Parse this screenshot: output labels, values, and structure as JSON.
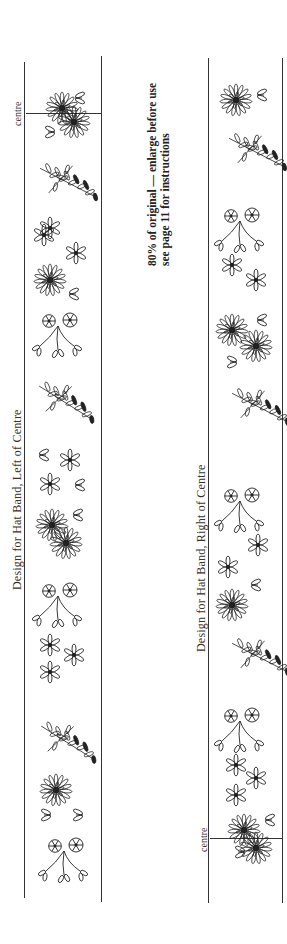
{
  "page": {
    "orientation": "rotated-90",
    "note": {
      "line1": "80% of original — enlarge before use",
      "line2": "see page 11 for instructions"
    }
  },
  "bands": [
    {
      "id": "left-of-centre",
      "title": "Design for Hat Band, Left of Centre",
      "centre_label": "centre",
      "motifs": [
        "double-daisy-cluster",
        "leaf-bud",
        "leaf-bud",
        "fern-sprig",
        "star-flower",
        "star-flower",
        "leaf-bud",
        "single-daisy",
        "leaf-bud",
        "twin-rosette-sprig",
        "fern-sprig",
        "star-flower",
        "star-flower",
        "leaf-bud",
        "double-daisy-cluster",
        "leaf-bud",
        "twin-rosette-sprig",
        "star-flower",
        "star-flower",
        "star-flower",
        "fern-sprig",
        "single-daisy",
        "leaf-bud",
        "leaf-bud",
        "twin-rosette-sprig"
      ]
    },
    {
      "id": "right-of-centre",
      "title": "Design for Hat Band, Right of Centre",
      "centre_label": "centre",
      "motifs": [
        "single-daisy",
        "leaf-bud",
        "fern-sprig",
        "twin-rosette-sprig",
        "star-flower",
        "star-flower",
        "double-daisy-cluster",
        "leaf-bud",
        "leaf-bud",
        "fern-sprig",
        "twin-rosette-sprig",
        "star-flower",
        "star-flower",
        "leaf-bud",
        "single-daisy",
        "fern-sprig",
        "twin-rosette-sprig",
        "star-flower",
        "star-flower",
        "star-flower",
        "double-daisy-cluster",
        "leaf-bud",
        "leaf-bud"
      ]
    }
  ],
  "colors": {
    "ink": "#1a1a1a",
    "paper": "#ffffff"
  }
}
